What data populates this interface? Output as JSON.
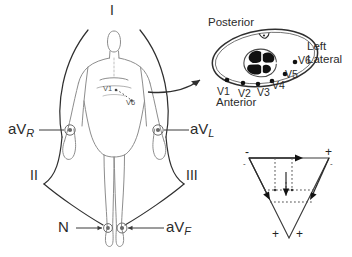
{
  "figure": {
    "title_text": "",
    "colors": {
      "ink": "#2b2b2b",
      "body_outline": "#8a8a8a",
      "electrode": "#777777",
      "heart_fill": "#1a1a1a",
      "background": "#ffffff"
    }
  },
  "limb_leads": {
    "lead_I": "I",
    "lead_II": "II",
    "lead_III": "III",
    "avr": "aV",
    "avr_sub": "R",
    "avl": "aV",
    "avl_sub": "L",
    "avf": "aV",
    "avf_sub": "F",
    "neutral": "N"
  },
  "torso_chest_labels": {
    "v1": "V1",
    "v6": "V6"
  },
  "cross_section": {
    "posterior": "Posterior",
    "anterior": "Anterior",
    "left": "Left",
    "lateral": "Lateral",
    "electrodes": [
      {
        "name": "V1",
        "label": "V1"
      },
      {
        "name": "V2",
        "label": "V2"
      },
      {
        "name": "V3",
        "label": "V3"
      },
      {
        "name": "V4",
        "label": "V4"
      },
      {
        "name": "V5",
        "label": "V5"
      },
      {
        "name": "V6",
        "label": "V6"
      }
    ]
  },
  "einthoven_triangle": {
    "top_left_sign": "-",
    "top_right_sign": "+",
    "upper_left_inner_sign": "-",
    "upper_right_inner_sign": "-",
    "bottom_left_sign": "+",
    "bottom_right_sign": "+"
  }
}
